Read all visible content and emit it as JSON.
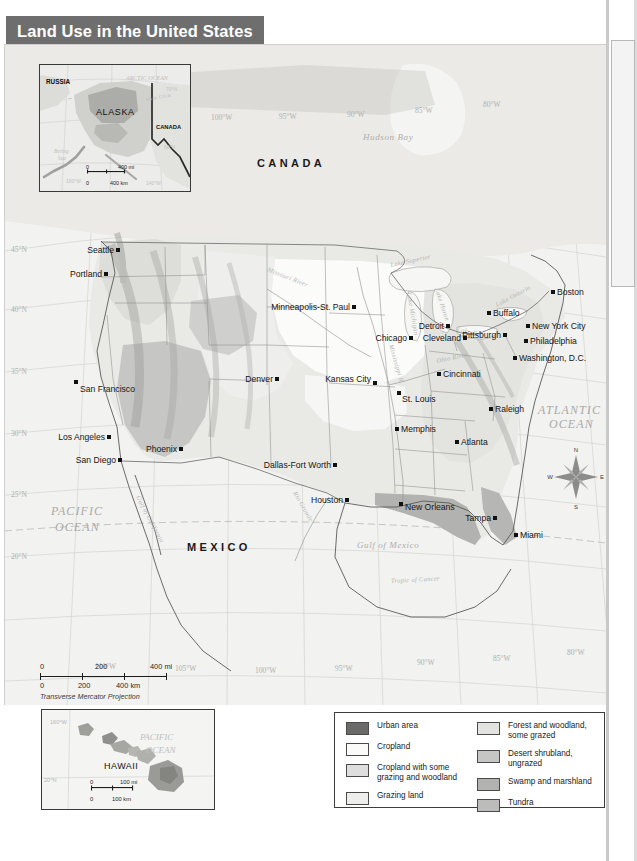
{
  "title": "Land Use in the United States",
  "map": {
    "projection_note": "Transverse Mercator Projection",
    "country_labels": [
      "CANADA",
      "MEXICO"
    ],
    "ocean_labels": [
      "PACIFIC OCEAN",
      "ATLANTIC OCEAN"
    ],
    "water_labels": [
      "Hudson Bay",
      "Gulf of Mexico",
      "Tropic of Cancer",
      "Gulf of California",
      "Rio Grande",
      "Missouri River",
      "Mississippi River",
      "Ohio River",
      "Lake Superior",
      "Lake Michigan",
      "Lake Huron",
      "Lake Erie",
      "Lake Ontario"
    ],
    "latitude_labels": [
      "45°N",
      "40°N",
      "35°N",
      "30°N",
      "25°N",
      "20°N"
    ],
    "longitude_labels_top": [
      "110°W",
      "105°W",
      "100°W",
      "95°W",
      "90°W",
      "85°W",
      "80°W"
    ],
    "longitude_labels_bottom": [
      "110°W",
      "105°W",
      "100°W",
      "95°W",
      "90°W",
      "85°W",
      "80°W"
    ],
    "cities": [
      {
        "name": "Seattle",
        "x": 113,
        "y": 205,
        "anchor": "end",
        "dx": -4,
        "dy": 3
      },
      {
        "name": "Portland",
        "x": 101,
        "y": 229,
        "anchor": "end",
        "dx": -4,
        "dy": 3
      },
      {
        "name": "San Francisco",
        "x": 71,
        "y": 337,
        "anchor": "start",
        "dx": 4,
        "dy": 10
      },
      {
        "name": "Los Angeles",
        "x": 104,
        "y": 392,
        "anchor": "end",
        "dx": -4,
        "dy": 3
      },
      {
        "name": "San Diego",
        "x": 115,
        "y": 415,
        "anchor": "end",
        "dx": -4,
        "dy": 3
      },
      {
        "name": "Phoenix",
        "x": 176,
        "y": 404,
        "anchor": "end",
        "dx": -4,
        "dy": 3
      },
      {
        "name": "Denver",
        "x": 272,
        "y": 334,
        "anchor": "end",
        "dx": -4,
        "dy": 3
      },
      {
        "name": "Minneapolis-St. Paul",
        "x": 349,
        "y": 262,
        "anchor": "end",
        "dx": -4,
        "dy": 3
      },
      {
        "name": "Kansas City",
        "x": 370,
        "y": 338,
        "anchor": "end",
        "dx": -4,
        "dy": -1
      },
      {
        "name": "St. Louis",
        "x": 394,
        "y": 348,
        "anchor": "start",
        "dx": 3,
        "dy": 9
      },
      {
        "name": "Chicago",
        "x": 406,
        "y": 293,
        "anchor": "end",
        "dx": -4,
        "dy": 3
      },
      {
        "name": "Memphis",
        "x": 392,
        "y": 384,
        "anchor": "start",
        "dx": 4,
        "dy": 3
      },
      {
        "name": "Dallas-Fort Worth",
        "x": 330,
        "y": 420,
        "anchor": "end",
        "dx": -4,
        "dy": 3
      },
      {
        "name": "Houston",
        "x": 342,
        "y": 455,
        "anchor": "end",
        "dx": -4,
        "dy": 3
      },
      {
        "name": "New Orleans",
        "x": 396,
        "y": 459,
        "anchor": "start",
        "dx": 4,
        "dy": 6
      },
      {
        "name": "Atlanta",
        "x": 452,
        "y": 397,
        "anchor": "start",
        "dx": 4,
        "dy": 3
      },
      {
        "name": "Tampa",
        "x": 490,
        "y": 473,
        "anchor": "end",
        "dx": -4,
        "dy": 3
      },
      {
        "name": "Miami",
        "x": 511,
        "y": 490,
        "anchor": "start",
        "dx": 4,
        "dy": 3
      },
      {
        "name": "Detroit",
        "x": 443,
        "y": 281,
        "anchor": "end",
        "dx": -4,
        "dy": 3
      },
      {
        "name": "Cleveland",
        "x": 460,
        "y": 293,
        "anchor": "end",
        "dx": -4,
        "dy": 3
      },
      {
        "name": "Cincinnati",
        "x": 434,
        "y": 329,
        "anchor": "start",
        "dx": 4,
        "dy": 3
      },
      {
        "name": "Buffalo",
        "x": 484,
        "y": 268,
        "anchor": "start",
        "dx": 4,
        "dy": 3
      },
      {
        "name": "Pittsburgh",
        "x": 500,
        "y": 290,
        "anchor": "end",
        "dx": -4,
        "dy": 3
      },
      {
        "name": "New York City",
        "x": 523,
        "y": 281,
        "anchor": "start",
        "dx": 4,
        "dy": 3
      },
      {
        "name": "Philadelphia",
        "x": 521,
        "y": 296,
        "anchor": "start",
        "dx": 4,
        "dy": 3
      },
      {
        "name": "Washington, D.C.",
        "x": 510,
        "y": 313,
        "anchor": "start",
        "dx": 4,
        "dy": 3
      },
      {
        "name": "Boston",
        "x": 548,
        "y": 247,
        "anchor": "start",
        "dx": 4,
        "dy": 3
      },
      {
        "name": "Raleigh",
        "x": 486,
        "y": 364,
        "anchor": "start",
        "dx": 4,
        "dy": 3
      }
    ],
    "compass": {
      "n": "N",
      "e": "E",
      "s": "S",
      "w": "W"
    },
    "scale": {
      "mi_labels": [
        "0",
        "200",
        "400 mi"
      ],
      "km_labels": [
        "0",
        "200",
        "400 km"
      ]
    }
  },
  "alaska_inset": {
    "region_labels": [
      "RUSSIA",
      "ALASKA",
      "CANADA"
    ],
    "water_labels": [
      "ARCTIC OCEAN",
      "Bering Sea"
    ],
    "line_labels": [
      "Arctic Circle"
    ],
    "grat_labels": [
      "70°N",
      "60°N",
      "160°W",
      "140°W"
    ],
    "scale": {
      "mi_labels": [
        "0",
        "400 mi"
      ],
      "km_labels": [
        "0",
        "400 km"
      ]
    }
  },
  "hawaii_inset": {
    "region_labels": [
      "HAWAII"
    ],
    "water_labels": [
      "PACIFIC OCEAN"
    ],
    "grat_labels": [
      "160°W",
      "20°N"
    ],
    "scale": {
      "mi_labels": [
        "0",
        "100 mi"
      ],
      "km_labels": [
        "0",
        "100 km"
      ]
    }
  },
  "legend": {
    "left_column": [
      {
        "label": "Urban area",
        "color": "#6a6a68"
      },
      {
        "label": "Cropland",
        "color": "#fbfbfa"
      },
      {
        "label": "Cropland with some\ngrazing and woodland",
        "color": "#dedede"
      },
      {
        "label": "Grazing land",
        "color": "#eeeeec"
      }
    ],
    "right_column": [
      {
        "label": "Forest and woodland,\nsome grazed",
        "color": "#e3e3e0"
      },
      {
        "label": "Desert shrubland,\nungrazed",
        "color": "#c6c6c4"
      },
      {
        "label": "Swamp and marshland",
        "color": "#b2b2b0"
      },
      {
        "label": "Tundra",
        "color": "#bcbcba"
      }
    ]
  },
  "colors": {
    "banner_bg": "#6e6e6e",
    "banner_text": "#ffffff",
    "map_bg": "#f2f2f0",
    "graticule": "#d2d2d0",
    "border": "#6a6a68"
  }
}
